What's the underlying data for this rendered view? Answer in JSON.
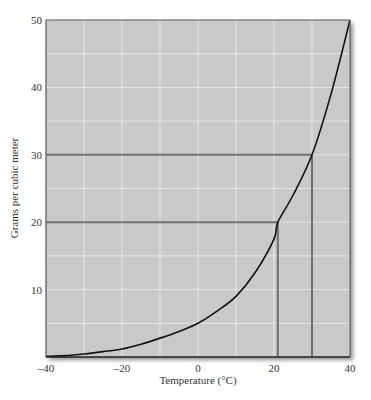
{
  "chart_data": {
    "type": "line",
    "title": "",
    "xlabel": "Temperature (°C)",
    "ylabel": "Grams per cubic meter",
    "xlim": [
      -40,
      40
    ],
    "ylim": [
      0,
      50
    ],
    "x_ticks": [
      -40,
      -20,
      0,
      20,
      40
    ],
    "y_ticks": [
      10,
      20,
      30,
      40,
      50
    ],
    "x_tick_labels": [
      "–40",
      "–20",
      "0",
      "20",
      "40"
    ],
    "y_tick_labels": [
      "10",
      "20",
      "30",
      "40",
      "50"
    ],
    "grid": true,
    "grid_x_step": 10,
    "grid_y_step": 5,
    "legend": null,
    "series": [
      {
        "name": "Saturation water vapor content",
        "x": [
          -40,
          -35,
          -30,
          -25,
          -20,
          -15,
          -10,
          -5,
          0,
          5,
          10,
          15,
          20,
          21,
          25,
          30,
          35,
          40
        ],
        "y": [
          0.1,
          0.2,
          0.45,
          0.8,
          1.2,
          1.9,
          2.8,
          3.8,
          5.0,
          6.8,
          9.0,
          12.5,
          17.5,
          20,
          24,
          30,
          39,
          50
        ]
      }
    ],
    "annotations": [
      {
        "type": "reference-line",
        "from": [
          -40,
          30
        ],
        "to": [
          30,
          30
        ],
        "then_down_to": [
          30,
          0
        ]
      },
      {
        "type": "reference-line",
        "from": [
          -40,
          20
        ],
        "to": [
          21,
          20
        ],
        "then_down_to": [
          21,
          0
        ]
      }
    ]
  },
  "style": {
    "plot_background": "#c9c9c9",
    "grid_color": "#e6e6e6",
    "curve_color": "#111111",
    "reference_line_color": "#707070",
    "axis_color": "#555555"
  }
}
